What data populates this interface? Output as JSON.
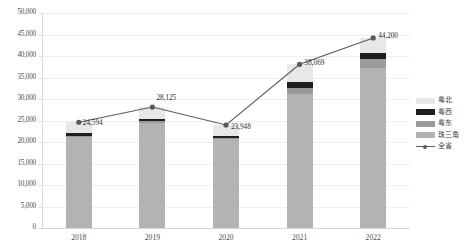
{
  "chart_data": {
    "type": "bar",
    "subtype": "stacked-column-with-line",
    "title": "",
    "subtitle": "",
    "xlabel": "",
    "ylabel": "",
    "categories": [
      "2018",
      "2019",
      "2020",
      "2021",
      "2022"
    ],
    "ylim": [
      0,
      50000
    ],
    "ytick_step": 5000,
    "ytick_labels": [
      "0",
      "5,000",
      "10,000",
      "15,000",
      "20,000",
      "25,000",
      "30,000",
      "35,000",
      "40,000",
      "45,000",
      "50,000"
    ],
    "ytick_values": [
      0,
      5000,
      10000,
      15000,
      20000,
      25000,
      30000,
      35000,
      40000,
      45000,
      50000
    ],
    "grid": true,
    "legend_position": "right",
    "series": [
      {
        "name": "珠三角",
        "type": "bar",
        "stack": "total",
        "color": "#b3b3b3",
        "values": [
          21100,
          24400,
          20600,
          31200,
          37300
        ]
      },
      {
        "name": "粤东",
        "type": "bar",
        "stack": "total",
        "color": "#9a9a9a",
        "values": [
          400,
          380,
          360,
          1250,
          1900
        ]
      },
      {
        "name": "粤西",
        "type": "bar",
        "stack": "total",
        "color": "#1f1f1f",
        "values": [
          500,
          480,
          470,
          1500,
          1600
        ]
      },
      {
        "name": "粤北",
        "type": "bar",
        "stack": "total",
        "color": "#e8e8e8",
        "values": [
          2594,
          2865,
          2518,
          4119,
          3400
        ]
      },
      {
        "name": "全省",
        "type": "line",
        "color": "#5a5a5a",
        "marker": "circle",
        "values": [
          24594,
          28125,
          23948,
          38069,
          44200
        ],
        "point_labels": [
          "24,594",
          "28,125",
          "23,948",
          "38,069",
          "44,200"
        ]
      }
    ],
    "legend_entries": [
      {
        "label": "粤北",
        "color": "#e8e8e8",
        "marker": "swatch"
      },
      {
        "label": "粤西",
        "color": "#1f1f1f",
        "marker": "swatch"
      },
      {
        "label": "粤东",
        "color": "#9a9a9a",
        "marker": "swatch"
      },
      {
        "label": "珠三角",
        "color": "#b3b3b3",
        "marker": "swatch"
      },
      {
        "label": "全省",
        "color": "#5a5a5a",
        "marker": "line-point"
      }
    ]
  },
  "colors": {
    "grid": "#eceef0",
    "axis": "#d4d6d9",
    "tick_text": "#4d4d4d",
    "label_text": "#2b2b2b",
    "background": "#ffffff"
  }
}
